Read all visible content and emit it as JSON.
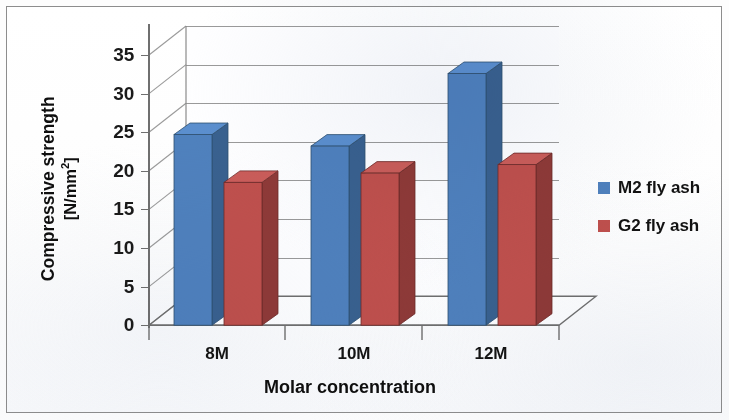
{
  "figure": {
    "background_color": "#fdfdfd",
    "frame_color": "#8d8d8d"
  },
  "axes": {
    "y_title_line1": "Compressive strength",
    "y_title_line2_prefix": "[N/mm",
    "y_title_line2_sup": "2",
    "y_title_line2_suffix": "]",
    "x_title": "Molar concentration"
  },
  "legend": {
    "position": "right",
    "items": [
      {
        "label": "M2 fly ash",
        "color": "#4f81bd"
      },
      {
        "label": "G2 fly ash",
        "color": "#c0504d"
      }
    ]
  },
  "chart_data": {
    "type": "bar",
    "style": "3d-clustered-column",
    "title": "",
    "subtitle": "",
    "xlabel": "Molar concentration",
    "ylabel": "Compressive strength [N/mm2]",
    "categories": [
      "8M",
      "10M",
      "12M"
    ],
    "ylim": [
      0,
      35
    ],
    "yticks": [
      0,
      5,
      10,
      15,
      20,
      25,
      30,
      35
    ],
    "ytick_labels": [
      "0",
      "5",
      "10",
      "15",
      "20",
      "25",
      "30",
      "35"
    ],
    "grid": true,
    "grid_axis": "y",
    "legend_position": "right",
    "series": [
      {
        "name": "M2 fly ash",
        "color": "#4f81bd",
        "side_color": "#39618f",
        "top_color": "#5b8fce",
        "values": [
          24.7,
          23.2,
          32.6
        ]
      },
      {
        "name": "G2 fly ash",
        "color": "#c0504d",
        "side_color": "#8f3a38",
        "top_color": "#cb5d5a",
        "values": [
          18.5,
          19.7,
          20.8
        ]
      }
    ]
  }
}
